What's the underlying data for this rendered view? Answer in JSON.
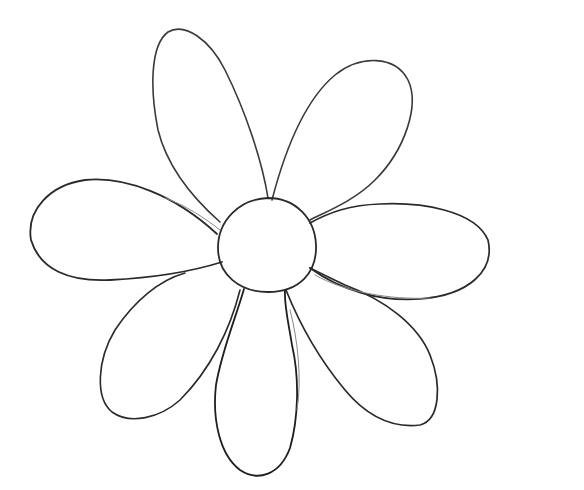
{
  "image": {
    "subject": "flower line drawing",
    "width": 584,
    "height": 490,
    "background": "#ffffff",
    "stroke_color": "#2a2a2a",
    "stroke_light": "#6a6a6a",
    "petal_count": 8
  }
}
